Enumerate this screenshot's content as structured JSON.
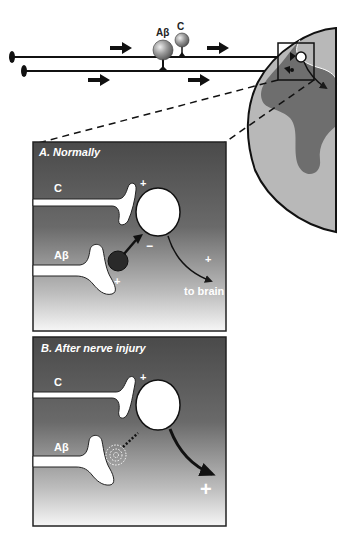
{
  "overview": {
    "fiber_labels": {
      "abeta": "Aβ",
      "c": "C"
    }
  },
  "panel_a": {
    "title": "A. Normally",
    "c_label": "C",
    "abeta_label": "Aβ",
    "plus_c": "+",
    "minus_inhib": "−",
    "plus_abeta": "+",
    "plus_output": "+",
    "output_label": "to brain"
  },
  "panel_b": {
    "title": "B. After nerve injury",
    "c_label": "C",
    "abeta_label": "Aβ",
    "plus_c": "+",
    "plus_output": "+"
  },
  "colors": {
    "panel_dark": "#505050",
    "panel_light": "#f4f4f4",
    "cord_gray_matter": "#6e6e6e",
    "cord_white_matter": "#b8b8b8",
    "stroke": "#1a1a1a"
  }
}
